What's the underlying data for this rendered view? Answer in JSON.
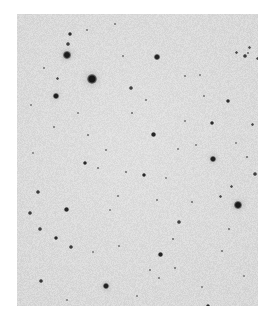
{
  "image": {
    "kind": "astronomical-sky-survey-cutout",
    "description": "Grayscale photographic plate cutout of a star field; dark point sources on a light mottled background",
    "width": 276,
    "height": 324,
    "canvas_background_color": "#ffffff",
    "plate": {
      "x": 17,
      "y": 14,
      "width": 241,
      "height": 292,
      "background_color": "#e9e9e9",
      "grain_color": "#c9c9c9",
      "grain_density": 0.3
    },
    "star_color": "#161616",
    "star_color_faint": "#5a5a5a"
  },
  "chart_data": {
    "type": "scatter",
    "title": "",
    "xlabel": "",
    "ylabel": "",
    "xlim": [
      17,
      258
    ],
    "ylim": [
      14,
      306
    ],
    "grid": false,
    "legend": null,
    "note": "Each point is a detected source; r = apparent radius in px, mag = relative darkness 0-1 (1 = darkest/brightest source)",
    "points": [
      {
        "x": 92,
        "y": 79,
        "r": 5.2,
        "mag": 1.0
      },
      {
        "x": 67,
        "y": 55,
        "r": 3.6,
        "mag": 0.95
      },
      {
        "x": 56,
        "y": 96,
        "r": 3.4,
        "mag": 0.94
      },
      {
        "x": 238,
        "y": 205,
        "r": 4.0,
        "mag": 0.97
      },
      {
        "x": 213,
        "y": 159,
        "r": 3.2,
        "mag": 0.9
      },
      {
        "x": 106,
        "y": 286,
        "r": 3.1,
        "mag": 0.9
      },
      {
        "x": 157,
        "y": 57,
        "r": 2.8,
        "mag": 0.88
      },
      {
        "x": 70,
        "y": 34,
        "r": 1.9,
        "mag": 0.78
      },
      {
        "x": 68,
        "y": 44,
        "r": 1.6,
        "mag": 0.62
      },
      {
        "x": 153,
        "y": 134,
        "r": 2.5,
        "mag": 0.86
      },
      {
        "x": 144,
        "y": 175,
        "r": 2.4,
        "mag": 0.84
      },
      {
        "x": 160,
        "y": 254,
        "r": 2.5,
        "mag": 0.86
      },
      {
        "x": 85,
        "y": 163,
        "r": 2.4,
        "mag": 0.84
      },
      {
        "x": 66,
        "y": 209,
        "r": 2.5,
        "mag": 0.85
      },
      {
        "x": 56,
        "y": 238,
        "r": 2.4,
        "mag": 0.84
      },
      {
        "x": 71,
        "y": 247,
        "r": 1.7,
        "mag": 0.66
      },
      {
        "x": 40,
        "y": 229,
        "r": 1.6,
        "mag": 0.62
      },
      {
        "x": 38,
        "y": 192,
        "r": 1.7,
        "mag": 0.66
      },
      {
        "x": 30,
        "y": 213,
        "r": 1.7,
        "mag": 0.66
      },
      {
        "x": 41,
        "y": 281,
        "r": 1.8,
        "mag": 0.7
      },
      {
        "x": 208,
        "y": 306,
        "r": 2.3,
        "mag": 0.83
      },
      {
        "x": 212,
        "y": 123,
        "r": 2.3,
        "mag": 0.82
      },
      {
        "x": 228,
        "y": 101,
        "r": 2.2,
        "mag": 0.8
      },
      {
        "x": 245,
        "y": 56,
        "r": 1.7,
        "mag": 0.66
      },
      {
        "x": 236,
        "y": 52,
        "r": 1.5,
        "mag": 0.58
      },
      {
        "x": 257,
        "y": 58,
        "r": 1.5,
        "mag": 0.56
      },
      {
        "x": 249,
        "y": 47,
        "r": 1.5,
        "mag": 0.56
      },
      {
        "x": 252,
        "y": 124,
        "r": 1.5,
        "mag": 0.58
      },
      {
        "x": 255,
        "y": 174,
        "r": 1.6,
        "mag": 0.62
      },
      {
        "x": 248,
        "y": 53,
        "r": 1.3,
        "mag": 0.5
      },
      {
        "x": 247,
        "y": 157,
        "r": 1.4,
        "mag": 0.54
      },
      {
        "x": 231,
        "y": 186,
        "r": 1.5,
        "mag": 0.58
      },
      {
        "x": 220,
        "y": 196,
        "r": 1.5,
        "mag": 0.58
      },
      {
        "x": 229,
        "y": 229,
        "r": 1.3,
        "mag": 0.5
      },
      {
        "x": 222,
        "y": 251,
        "r": 1.2,
        "mag": 0.46
      },
      {
        "x": 179,
        "y": 222,
        "r": 1.6,
        "mag": 0.62
      },
      {
        "x": 192,
        "y": 202,
        "r": 1.3,
        "mag": 0.5
      },
      {
        "x": 173,
        "y": 239,
        "r": 1.4,
        "mag": 0.54
      },
      {
        "x": 175,
        "y": 268,
        "r": 1.4,
        "mag": 0.52
      },
      {
        "x": 159,
        "y": 278,
        "r": 1.2,
        "mag": 0.44
      },
      {
        "x": 150,
        "y": 270,
        "r": 1.3,
        "mag": 0.48
      },
      {
        "x": 157,
        "y": 200,
        "r": 1.2,
        "mag": 0.44
      },
      {
        "x": 118,
        "y": 196,
        "r": 1.2,
        "mag": 0.44
      },
      {
        "x": 126,
        "y": 172,
        "r": 1.3,
        "mag": 0.48
      },
      {
        "x": 98,
        "y": 168,
        "r": 1.3,
        "mag": 0.48
      },
      {
        "x": 88,
        "y": 135,
        "r": 1.3,
        "mag": 0.48
      },
      {
        "x": 106,
        "y": 150,
        "r": 1.2,
        "mag": 0.44
      },
      {
        "x": 132,
        "y": 113,
        "r": 1.4,
        "mag": 0.52
      },
      {
        "x": 146,
        "y": 100,
        "r": 1.2,
        "mag": 0.44
      },
      {
        "x": 131,
        "y": 88,
        "r": 1.6,
        "mag": 0.62
      },
      {
        "x": 57,
        "y": 78,
        "r": 1.5,
        "mag": 0.58
      },
      {
        "x": 54,
        "y": 127,
        "r": 1.2,
        "mag": 0.42
      },
      {
        "x": 87,
        "y": 30,
        "r": 1.2,
        "mag": 0.42
      },
      {
        "x": 115,
        "y": 24,
        "r": 1.2,
        "mag": 0.42
      },
      {
        "x": 44,
        "y": 68,
        "r": 1.2,
        "mag": 0.42
      },
      {
        "x": 123,
        "y": 56,
        "r": 1.1,
        "mag": 0.38
      },
      {
        "x": 185,
        "y": 76,
        "r": 1.2,
        "mag": 0.42
      },
      {
        "x": 200,
        "y": 75,
        "r": 1.1,
        "mag": 0.38
      },
      {
        "x": 204,
        "y": 96,
        "r": 1.1,
        "mag": 0.38
      },
      {
        "x": 185,
        "y": 121,
        "r": 1.1,
        "mag": 0.38
      },
      {
        "x": 178,
        "y": 149,
        "r": 1.1,
        "mag": 0.36
      },
      {
        "x": 196,
        "y": 145,
        "r": 1.1,
        "mag": 0.36
      },
      {
        "x": 119,
        "y": 246,
        "r": 1.1,
        "mag": 0.38
      },
      {
        "x": 93,
        "y": 252,
        "r": 1.0,
        "mag": 0.34
      },
      {
        "x": 67,
        "y": 300,
        "r": 1.0,
        "mag": 0.34
      },
      {
        "x": 137,
        "y": 296,
        "r": 1.0,
        "mag": 0.32
      },
      {
        "x": 202,
        "y": 287,
        "r": 1.0,
        "mag": 0.32
      },
      {
        "x": 33,
        "y": 153,
        "r": 1.0,
        "mag": 0.34
      },
      {
        "x": 31,
        "y": 105,
        "r": 1.0,
        "mag": 0.32
      },
      {
        "x": 78,
        "y": 113,
        "r": 1.0,
        "mag": 0.32
      },
      {
        "x": 110,
        "y": 210,
        "r": 1.0,
        "mag": 0.3
      },
      {
        "x": 244,
        "y": 276,
        "r": 1.0,
        "mag": 0.3
      },
      {
        "x": 166,
        "y": 178,
        "r": 1.0,
        "mag": 0.3
      },
      {
        "x": 236,
        "y": 143,
        "r": 1.0,
        "mag": 0.32
      }
    ]
  }
}
